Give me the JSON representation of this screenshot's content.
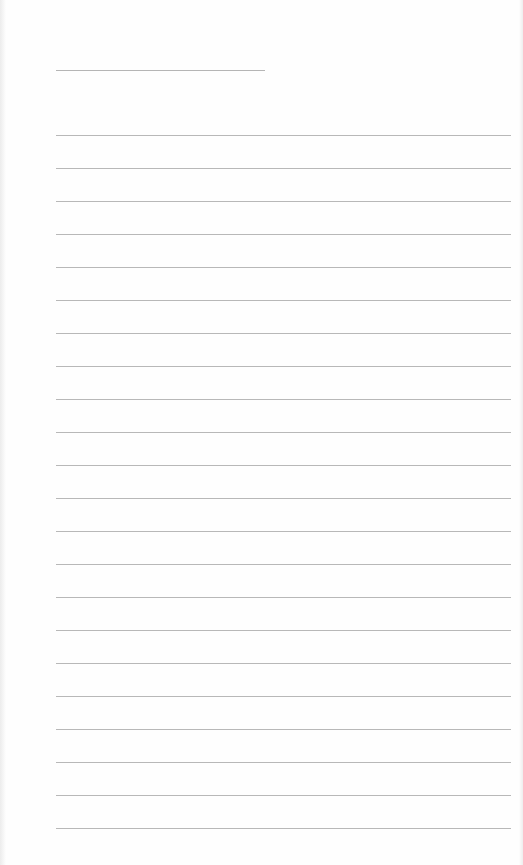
{
  "page": {
    "type": "lined-paper",
    "background": "#fefefe",
    "line_color": "#b8b8b8",
    "title_line": {
      "x": 56,
      "y": 70,
      "width": 209
    },
    "rules": {
      "count": 22,
      "start_y": 135,
      "spacing": 33,
      "x": 56,
      "width": 455
    }
  }
}
